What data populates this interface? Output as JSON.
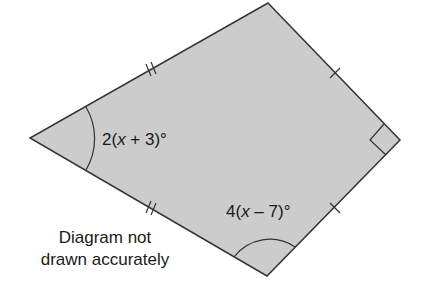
{
  "diagram": {
    "shape": "kite",
    "fill_color": "#cccccc",
    "stroke_color": "#333333",
    "vertices": {
      "top": [
        268,
        3
      ],
      "right": [
        400,
        140
      ],
      "bottom": [
        267,
        276
      ],
      "left": [
        30,
        138
      ]
    },
    "angles": {
      "left": {
        "prefix": "2(",
        "var": "x",
        "suffix": " + 3)°"
      },
      "bottom": {
        "prefix": "4(",
        "var": "x",
        "suffix": " – 7)°"
      },
      "right": {
        "marker": "right-angle"
      }
    },
    "edge_marks": {
      "upper_left": "double-tick",
      "lower_left": "double-tick",
      "upper_right": "single-tick",
      "lower_right": "single-tick"
    },
    "note_line1": "Diagram not",
    "note_line2": "drawn accurately"
  }
}
